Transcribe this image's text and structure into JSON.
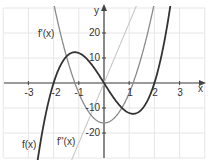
{
  "chart_data": {
    "type": "line",
    "title": "",
    "xlabel": "x",
    "ylabel": "y",
    "xlim": [
      -4,
      4
    ],
    "ylim": [
      -30,
      30
    ],
    "grid": true,
    "x_ticks": [
      "-3",
      "-2",
      "-1",
      "1",
      "2",
      "3"
    ],
    "y_ticks": [
      "20",
      "10",
      "-10",
      "-20"
    ],
    "series": [
      {
        "name": "f(x)",
        "formula": "4x^3 - 16x",
        "color": "#333333",
        "width": 1.8,
        "points": [
          [
            -2.5,
            -22.5
          ],
          [
            -2,
            0
          ],
          [
            -1.155,
            12.3
          ],
          [
            0,
            0
          ],
          [
            1.155,
            -12.3
          ],
          [
            2,
            0
          ],
          [
            2.5,
            22.5
          ]
        ]
      },
      {
        "name": "f'(x)",
        "formula": "12x^2 - 16",
        "color": "#8a8a8a",
        "width": 1.3,
        "points": [
          [
            -1.83,
            24.2
          ],
          [
            -1.155,
            0
          ],
          [
            0,
            -16
          ],
          [
            1.155,
            0
          ],
          [
            1.83,
            24.2
          ]
        ]
      },
      {
        "name": "f''(x)",
        "formula": "24x",
        "color": "#c8c8c8",
        "width": 1.1,
        "points": [
          [
            -1.25,
            -30
          ],
          [
            0,
            0
          ],
          [
            1.25,
            30
          ]
        ]
      }
    ],
    "annotations": [
      {
        "text": "f'(x)",
        "x": -2.3,
        "y": 19
      },
      {
        "text": "f(x)",
        "x": -3.2,
        "y": -25
      },
      {
        "text": "f''(x)",
        "x": -1.3,
        "y": -24
      }
    ]
  },
  "labels": {
    "x_axis": "x",
    "y_axis": "y",
    "f": "f(x)",
    "f1": "f'(x)",
    "f2": "f''(x)",
    "xt": [
      "-3",
      "-2",
      "-1",
      "1",
      "2",
      "3"
    ],
    "yt": [
      "20",
      "10",
      "-10",
      "-20"
    ]
  }
}
